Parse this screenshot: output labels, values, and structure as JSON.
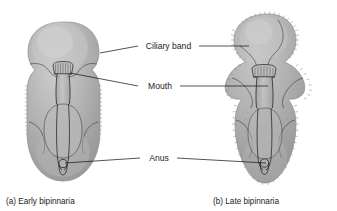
{
  "figure": {
    "background_color": "#ffffff",
    "ink_color": "#1c1c1c",
    "body_fill": "#a9a9a9",
    "body_fill_light": "#c2c2c2",
    "body_fill_dark": "#939393",
    "cilia_color": "#8e8e8e"
  },
  "labels": {
    "ciliary_band": "Ciliary band",
    "mouth": "Mouth",
    "anus": "Anus"
  },
  "captions": {
    "left": "(a) Early bipinnaria",
    "right": "(b) Late bipinnaria"
  },
  "specimens": [
    {
      "id": "early-bipinnaria",
      "caption": "(a) Early bipinnaria",
      "stage": "early",
      "outline_shape": "rounded oval with paired lateral indentations",
      "structures": [
        "ciliary band",
        "mouth",
        "esophagus",
        "stomach",
        "intestine",
        "anus"
      ]
    },
    {
      "id": "late-bipinnaria",
      "caption": "(b) Late bipinnaria",
      "stage": "late",
      "outline_shape": "elongated lobed body with projecting ciliated arms",
      "structures": [
        "ciliary band",
        "mouth",
        "esophagus",
        "stomach",
        "intestine",
        "anus"
      ]
    }
  ],
  "leader_lines": [
    {
      "label": "Ciliary band",
      "targets": [
        "early-bipinnaria",
        "late-bipinnaria"
      ]
    },
    {
      "label": "Mouth",
      "targets": [
        "early-bipinnaria",
        "late-bipinnaria"
      ]
    },
    {
      "label": "Anus",
      "targets": [
        "early-bipinnaria",
        "late-bipinnaria"
      ]
    }
  ]
}
